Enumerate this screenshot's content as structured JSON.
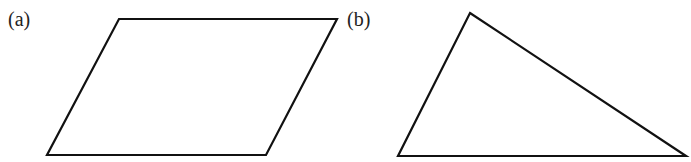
{
  "figures": [
    {
      "label": "(a)",
      "shape": "parallelogram",
      "points": "119,19 337,19 266,155 47,155",
      "label_pos": {
        "x": 8,
        "y": 9
      }
    },
    {
      "label": "(b)",
      "shape": "triangle",
      "points": "470,13 686,156 398,156",
      "label_pos": {
        "x": 347,
        "y": 9
      }
    }
  ],
  "colors": {
    "stroke": "#111111",
    "background": "#ffffff"
  }
}
